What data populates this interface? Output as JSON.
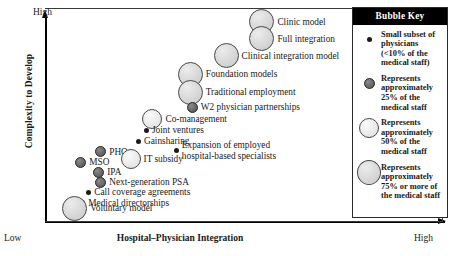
{
  "chart_data": {
    "type": "scatter",
    "title": "",
    "xlabel": "Hospital–Physician Integration",
    "ylabel": "Complexity to Develop",
    "x_axis_ends": {
      "low": "Low",
      "high": "High"
    },
    "y_axis_ends": {
      "low": "Low",
      "high": "High"
    },
    "grid": false,
    "legend_position": "right",
    "size_tiers": {
      "tiny": "Small subset of physicians (<10% of the medical staff)",
      "small": "Represents approximately 25% of the medical staff",
      "mid": "Represents approximately 50% of the medical staff",
      "large": "Represents approximately 75% or more of the medical staff"
    },
    "points": [
      {
        "label": "Clinic model",
        "size": "large",
        "x": 0.545,
        "y": 0.935
      },
      {
        "label": "Full integration",
        "size": "large",
        "x": 0.545,
        "y": 0.855
      },
      {
        "label": "Clinical integration model",
        "size": "large",
        "x": 0.455,
        "y": 0.775
      },
      {
        "label": "Foundation models",
        "size": "large",
        "x": 0.365,
        "y": 0.69
      },
      {
        "label": "Traditional employment",
        "size": "large",
        "x": 0.365,
        "y": 0.605
      },
      {
        "label": "W2 physician partnerships",
        "size": "small",
        "x": 0.37,
        "y": 0.535
      },
      {
        "label": "Co-management",
        "size": "mid",
        "x": 0.27,
        "y": 0.48
      },
      {
        "label": "Joint ventures",
        "size": "tiny",
        "x": 0.255,
        "y": 0.425
      },
      {
        "label": "Gainsharing",
        "size": "tiny",
        "x": 0.235,
        "y": 0.375
      },
      {
        "label": "Expansion of employed\nhospital-based specialists",
        "size": "tiny",
        "x": 0.33,
        "y": 0.33
      },
      {
        "label": "PHO",
        "size": "small",
        "x": 0.14,
        "y": 0.325
      },
      {
        "label": "IT subsidy",
        "size": "mid",
        "x": 0.215,
        "y": 0.29
      },
      {
        "label": "MSO",
        "size": "small",
        "x": 0.09,
        "y": 0.275
      },
      {
        "label": "IPA",
        "size": "small",
        "x": 0.135,
        "y": 0.23
      },
      {
        "label": "Next-generation PSA",
        "size": "small",
        "x": 0.14,
        "y": 0.18
      },
      {
        "label": "Call coverage agreements",
        "size": "tiny",
        "x": 0.11,
        "y": 0.135
      },
      {
        "label": "Medical directorships",
        "size": "tiny",
        "x": 0.095,
        "y": 0.085
      },
      {
        "label": "Voluntary model",
        "size": "large",
        "x": 0.075,
        "y": 0.06
      }
    ]
  },
  "legend": {
    "title": "Bubble Key",
    "entries": [
      {
        "size": "tiny",
        "text": "Small subset of physicians (<10% of the medical staff)"
      },
      {
        "size": "small",
        "text": "Represents approximately 25% of the medical staff"
      },
      {
        "size": "mid",
        "text": "Represents approximately 50% of the medical staff"
      },
      {
        "size": "large",
        "text": "Represents approximately 75% or more of the medical staff"
      }
    ]
  }
}
